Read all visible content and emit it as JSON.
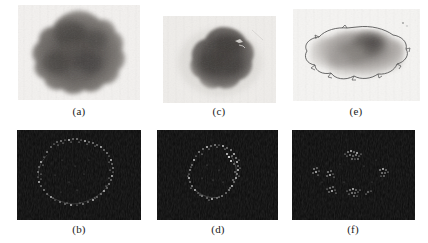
{
  "figure": {
    "width": 428,
    "height": 243,
    "background_color": "#ffffff",
    "rows": 2,
    "columns": 3
  },
  "panels": [
    {
      "id": "a",
      "label": "(a)",
      "row": "top",
      "column": 1,
      "kind": "grayscale-lesion",
      "content": "Large dark irregular pigmented lesion on light skin background",
      "background_color": "#f2f0ee",
      "lesion_color": "#5a5653",
      "has_contour": false
    },
    {
      "id": "b",
      "label": "(b)",
      "row": "bottom",
      "column": 1,
      "kind": "edge-response-map",
      "content": "Dark map with a bright closed ring of speckles tracing the lesion border",
      "background_color": "#0b0b0b",
      "speckle_color": "#d8d8d8",
      "has_contour": false
    },
    {
      "id": "c",
      "label": "(c)",
      "row": "top",
      "column": 2,
      "kind": "grayscale-lesion",
      "content": "Compact dark lesion with sharp border on light skin background",
      "background_color": "#eeece9",
      "lesion_color": "#4b4745",
      "has_contour": false
    },
    {
      "id": "d",
      "label": "(d)",
      "row": "bottom",
      "column": 2,
      "kind": "edge-response-map",
      "content": "Dark map with a bright oval ring of speckles outlining the lesion",
      "background_color": "#0b0b0b",
      "speckle_color": "#dedede",
      "has_contour": false
    },
    {
      "id": "e",
      "label": "(e)",
      "row": "top",
      "column": 3,
      "kind": "grayscale-lesion-with-contour",
      "content": "Faint diffuse lesion with a thin traced segmentation contour and a dark central core",
      "background_color": "#f4f3f1",
      "lesion_color": "#8c8885",
      "contour_color": "#4a4a4a",
      "has_contour": true
    },
    {
      "id": "f",
      "label": "(f)",
      "row": "bottom",
      "column": 3,
      "kind": "edge-response-map",
      "content": "Dark map with scattered disconnected bright speckle clusters, no closed ring",
      "background_color": "#0b0b0b",
      "speckle_color": "#d0d0d0",
      "has_contour": false
    }
  ]
}
